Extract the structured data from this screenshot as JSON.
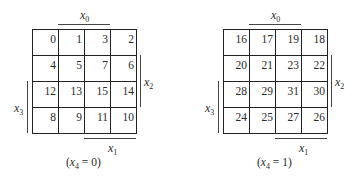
{
  "maps": [
    {
      "caption_var": "x",
      "caption_sub": "4",
      "caption_value": "0",
      "rows": [
        [
          "0",
          "1",
          "3",
          "2"
        ],
        [
          "4",
          "5",
          "7",
          "6"
        ],
        [
          "12",
          "13",
          "15",
          "14"
        ],
        [
          "8",
          "9",
          "11",
          "10"
        ]
      ]
    },
    {
      "caption_var": "x",
      "caption_sub": "4",
      "caption_value": "1",
      "rows": [
        [
          "16",
          "17",
          "19",
          "18"
        ],
        [
          "20",
          "21",
          "23",
          "22"
        ],
        [
          "28",
          "29",
          "31",
          "30"
        ],
        [
          "24",
          "25",
          "27",
          "26"
        ]
      ]
    }
  ],
  "labels": {
    "x0": {
      "var": "x",
      "sub": "0"
    },
    "x1": {
      "var": "x",
      "sub": "1"
    },
    "x2": {
      "var": "x",
      "sub": "2"
    },
    "x3": {
      "var": "x",
      "sub": "3"
    }
  }
}
